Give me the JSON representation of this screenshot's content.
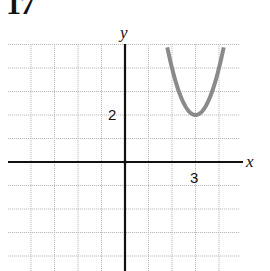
{
  "problem_number": "17",
  "chart_data": {
    "type": "line",
    "title": "",
    "xlabel": "x",
    "ylabel": "y",
    "function": "y = 2(x - 3)^2 + 2",
    "vertex": [
      3,
      2
    ],
    "tick_labels": {
      "x": [
        "3"
      ],
      "y": [
        "2"
      ]
    },
    "xlim": [
      -5,
      5
    ],
    "ylim": [
      -4.7,
      5
    ],
    "grid": true,
    "grid_step": 1,
    "series": [
      {
        "name": "parabola",
        "color": "#8a8a8a",
        "x": [
          1.8,
          2,
          2.25,
          2.5,
          2.75,
          3,
          3.25,
          3.5,
          3.75,
          4,
          4.2
        ],
        "y": [
          4.88,
          4,
          3.125,
          2.5,
          2.125,
          2,
          2.125,
          2.5,
          3.125,
          4,
          4.88
        ]
      }
    ]
  },
  "colors": {
    "axis": "#111111",
    "grid": "#bdbdbd",
    "curve": "#8a8a8a"
  }
}
